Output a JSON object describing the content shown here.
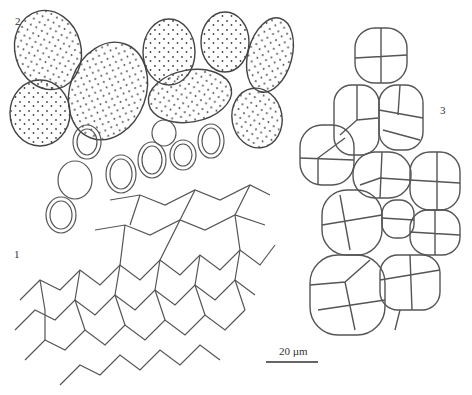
{
  "figure": {
    "panels": [
      {
        "id": "1",
        "label": "1",
        "description": "polygonal cells with thick double walls (exoperidium tissue)"
      },
      {
        "id": "2",
        "label": "2",
        "description": "ellipsoid spores with punctate/warty surface"
      },
      {
        "id": "3",
        "label": "3",
        "description": "clusters of septate multicellular bodies"
      }
    ],
    "scale_bar": {
      "label": "20 µm"
    }
  }
}
